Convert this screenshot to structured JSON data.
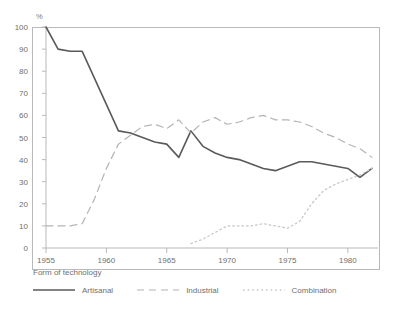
{
  "chart_data": {
    "type": "line",
    "title": "",
    "xlabel": "",
    "ylabel": "%",
    "unit_label": "%",
    "xlim": [
      1955,
      1982
    ],
    "ylim": [
      0,
      100
    ],
    "grid": false,
    "legend_position": "bottom",
    "legend_title": "Form of technology",
    "y_ticks": [
      100,
      90,
      80,
      70,
      60,
      50,
      40,
      30,
      20,
      10,
      0
    ],
    "x_ticks": [
      1955,
      1960,
      1965,
      1970,
      1975,
      1980
    ],
    "x": [
      1955,
      1956,
      1957,
      1958,
      1959,
      1960,
      1961,
      1962,
      1963,
      1964,
      1965,
      1966,
      1967,
      1968,
      1969,
      1970,
      1971,
      1972,
      1973,
      1974,
      1975,
      1976,
      1977,
      1978,
      1979,
      1980,
      1981,
      1982
    ],
    "series": [
      {
        "name": "Artisanal",
        "style": "solid",
        "color": "#5a5a5a",
        "values": [
          100,
          90,
          89,
          89,
          77,
          65,
          53,
          52,
          50,
          48,
          47,
          41,
          53,
          46,
          43,
          41,
          40,
          38,
          36,
          35,
          37,
          39,
          39,
          38,
          37,
          36,
          32,
          36
        ]
      },
      {
        "name": "Industrial",
        "style": "dashed",
        "color": "#b4b4b4",
        "values": [
          10,
          10,
          10,
          11,
          22,
          36,
          47,
          51,
          55,
          56,
          54,
          58,
          52,
          57,
          59,
          56,
          57,
          59,
          60,
          58,
          58,
          57,
          55,
          52,
          50,
          47,
          45,
          41
        ]
      },
      {
        "name": "Combination",
        "style": "dotted",
        "color": "#c8c8c8",
        "values": [
          null,
          null,
          null,
          null,
          null,
          null,
          null,
          null,
          null,
          null,
          null,
          null,
          2,
          4,
          7,
          10,
          10,
          10,
          11,
          10,
          9,
          12,
          20,
          26,
          29,
          31,
          33,
          36
        ]
      }
    ]
  },
  "legend": {
    "title": "Form of technology",
    "items": [
      {
        "label": "Artisanal",
        "style": "solid"
      },
      {
        "label": "Industrial",
        "style": "dashed"
      },
      {
        "label": "Combination",
        "style": "dotted"
      }
    ]
  },
  "axes": {
    "y_unit": "%",
    "y_ticks": [
      "100",
      "90",
      "80",
      "70",
      "60",
      "50",
      "40",
      "30",
      "20",
      "10",
      "0"
    ],
    "x_ticks": [
      "1955",
      "1960",
      "1965",
      "1970",
      "1975",
      "1980"
    ]
  },
  "colors": {
    "artisanal": "#5a5a5a",
    "industrial": "#b4b4b4",
    "combination": "#c8c8c8",
    "frame": "#b9b9b9",
    "text": "#6f6f6f",
    "background": "#ffffff"
  }
}
